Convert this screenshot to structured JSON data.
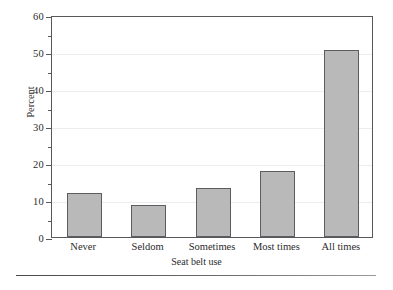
{
  "chart_data": {
    "type": "bar",
    "title": "",
    "xlabel": "Seat belt use",
    "ylabel": "Percent",
    "categories": [
      "Never",
      "Seldom",
      "Sometimes",
      "Most times",
      "All times"
    ],
    "values": [
      12.0,
      8.7,
      13.3,
      17.8,
      50.5
    ],
    "ylim": [
      0,
      60
    ],
    "yticks": [
      0,
      10,
      20,
      30,
      40,
      50,
      60
    ],
    "ytick_labels": [
      "0",
      "10",
      "20",
      "30",
      "40",
      "50",
      "60"
    ],
    "yminor_ticks": [
      5,
      15,
      25,
      35,
      45,
      55
    ],
    "grid": true,
    "legend": null,
    "bar_color": "#b9b9b9",
    "bar_edge_color": "#5d5d61",
    "frame_color": "#58585c",
    "grid_color": "#ededf0"
  },
  "figure": {
    "bottom_rule_color": "#4a4a4a"
  }
}
